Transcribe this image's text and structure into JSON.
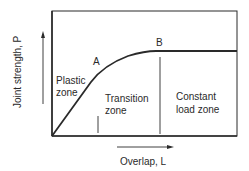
{
  "diagram": {
    "y_axis_label": "Joint strength, P",
    "x_axis_label": "Overlap, L",
    "points": [
      {
        "name": "A",
        "label": "A"
      },
      {
        "name": "B",
        "label": "B"
      }
    ],
    "zones": [
      {
        "line1": "Plastic",
        "line2": "zone"
      },
      {
        "line1": "Transition",
        "line2": "zone"
      },
      {
        "line1": "Constant",
        "line2": "load zone"
      }
    ],
    "colors": {
      "stroke": "#2a2a2a",
      "background": "#ffffff"
    }
  }
}
